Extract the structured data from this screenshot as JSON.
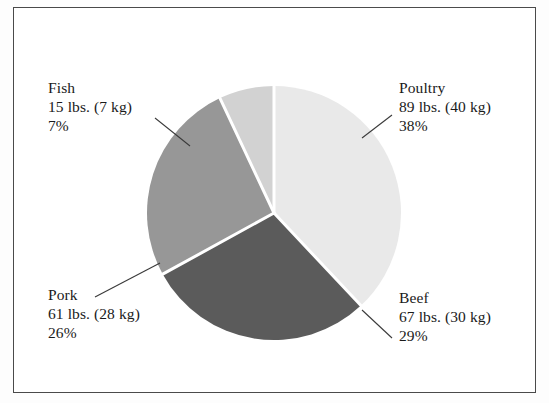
{
  "chart_data": {
    "type": "pie",
    "title": "",
    "subtitle": "",
    "xlabel": "",
    "ylabel": "",
    "legend_position": "none",
    "grid": false,
    "unit_primary": "lbs.",
    "unit_secondary": "kg",
    "categories": [
      "Poultry",
      "Beef",
      "Pork",
      "Fish"
    ],
    "values": [
      38,
      29,
      26,
      7
    ],
    "slices": [
      {
        "name": "Poultry",
        "label_name": "Poultry",
        "weight_text": "89 lbs. (40 kg)",
        "percent_text": "38%",
        "percent": 38,
        "lbs": 89,
        "kg": 40,
        "color": "#e9e9e9",
        "start_angle": 0,
        "end_angle": 136.8,
        "label_position": "top-right"
      },
      {
        "name": "Beef",
        "label_name": "Beef",
        "weight_text": "67 lbs. (30 kg)",
        "percent_text": "29%",
        "percent": 29,
        "lbs": 67,
        "kg": 30,
        "color": "#5b5b5b",
        "start_angle": 136.8,
        "end_angle": 241.2,
        "label_position": "bottom-right"
      },
      {
        "name": "Pork",
        "label_name": "Pork",
        "weight_text": "61 lbs. (28 kg)",
        "percent_text": "26%",
        "percent": 26,
        "lbs": 61,
        "kg": 28,
        "color": "#979797",
        "start_angle": 241.2,
        "end_angle": 334.8,
        "label_position": "bottom-left"
      },
      {
        "name": "Fish",
        "label_name": "Fish",
        "weight_text": "15 lbs. (7 kg)",
        "percent_text": "7%",
        "percent": 7,
        "lbs": 15,
        "kg": 7,
        "color": "#d2d2d2",
        "start_angle": 334.8,
        "end_angle": 360,
        "label_position": "top-left"
      }
    ]
  },
  "labels": {
    "fish": {
      "name": "Fish",
      "weight": "15 lbs. (7 kg)",
      "percent": "7%"
    },
    "poultry": {
      "name": "Poultry",
      "weight": "89 lbs. (40 kg)",
      "percent": "38%"
    },
    "pork": {
      "name": "Pork",
      "weight": "61 lbs. (28 kg)",
      "percent": "26%"
    },
    "beef": {
      "name": "Beef",
      "weight": "67 lbs. (30 kg)",
      "percent": "29%"
    }
  },
  "style": {
    "frame_color": "#4a4a4a",
    "background": "#ffffff",
    "text_color": "#1a1a1a",
    "separator_color": "#ffffff",
    "leader_color": "#3a3a3a"
  }
}
